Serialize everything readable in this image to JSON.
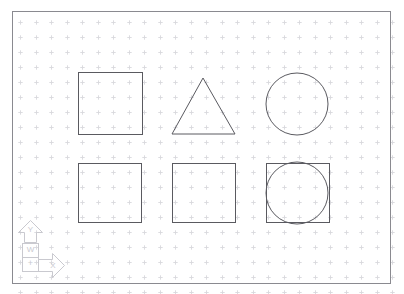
{
  "app": {
    "type": "cad-drawing-canvas",
    "title": "CAD Drawing Area",
    "background_color": "#ffffff"
  },
  "canvas": {
    "width": 404,
    "height": 294
  },
  "grid": {
    "visible": true,
    "marker": "cross-tick",
    "color": "#d8d8dc",
    "spacing_x": 15.5,
    "spacing_y": 15.0,
    "origin_x": 20,
    "origin_y": 22,
    "tick_size": 2.2
  },
  "frame": {
    "name": "drawing-limits-border",
    "color": "#8a8a90",
    "stroke_width": 1,
    "x": 12,
    "y": 11,
    "width": 378,
    "height": 272
  },
  "shapes": {
    "stroke_color": "#5a5a60",
    "fill": "none",
    "stroke_width": 1,
    "items": [
      {
        "id": "square-top-left",
        "label": "Square",
        "type": "rectangle",
        "row": 1,
        "column": 1,
        "x": 78,
        "y": 72,
        "width": 64,
        "height": 62
      },
      {
        "id": "triangle-top-center",
        "label": "Triangle",
        "type": "polygon",
        "row": 1,
        "column": 2,
        "points": "203,78 235,134 172,134"
      },
      {
        "id": "circle-top-right",
        "label": "Circle",
        "type": "circle",
        "row": 1,
        "column": 3,
        "cx": 297,
        "cy": 104,
        "r": 31
      },
      {
        "id": "square-bottom-left",
        "label": "Square",
        "type": "rectangle",
        "row": 2,
        "column": 1,
        "x": 78,
        "y": 163,
        "width": 63,
        "height": 59
      },
      {
        "id": "square-bottom-center",
        "label": "Square",
        "type": "rectangle",
        "row": 2,
        "column": 2,
        "x": 172,
        "y": 163,
        "width": 63,
        "height": 59
      },
      {
        "id": "square-bottom-right",
        "label": "Square with inscribed circle",
        "type": "rectangle",
        "row": 2,
        "column": 3,
        "x": 266,
        "y": 163,
        "width": 63,
        "height": 59
      },
      {
        "id": "circle-bottom-right-inscribed",
        "label": "Inscribed Circle",
        "type": "circle",
        "row": 2,
        "column": 3,
        "cx": 297,
        "cy": 193,
        "r": 31
      }
    ]
  },
  "ucs_icon": {
    "name": "ucs-coordinate-system-icon",
    "color": "#c9c9cf",
    "x_axis_label": "X",
    "y_axis_label": "Y",
    "plane_label": "W",
    "origin_label": "+",
    "origin_x": 22,
    "origin_y": 271
  }
}
